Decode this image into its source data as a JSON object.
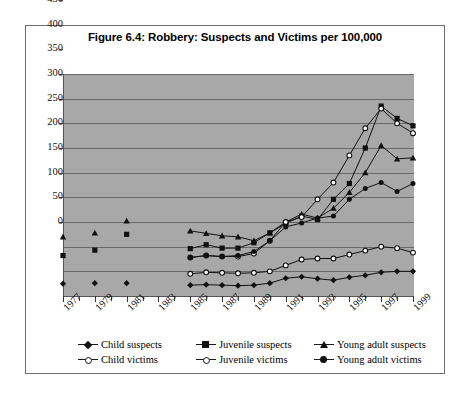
{
  "figure": {
    "title": "Figure 6.4: Robbery: Suspects and Victims per 100,000"
  },
  "legend": {
    "items": [
      {
        "label": "Child suspects",
        "marker": "diamond-filled"
      },
      {
        "label": "Juvenile suspects",
        "marker": "square-filled"
      },
      {
        "label": "Young adult suspects",
        "marker": "triangle-filled"
      },
      {
        "label": "Child victims",
        "marker": "circle-open"
      },
      {
        "label": "Juvenile victims",
        "marker": "circle-open"
      },
      {
        "label": "Young adult victims",
        "marker": "circle-filled"
      }
    ]
  },
  "chart_data": {
    "type": "line",
    "title": "Figure 6.4: Robbery: Suspects and Victims per 100,000",
    "xlabel": "",
    "ylabel": "",
    "ylim": [
      0,
      450
    ],
    "ytick_step": 50,
    "yticks": [
      "0",
      "50",
      "100",
      "150",
      "200",
      "250",
      "300",
      "350",
      "400",
      "450"
    ],
    "grid": true,
    "legend_position": "bottom",
    "plot_background": "#a8a8a8",
    "x": [
      1977,
      1978,
      1979,
      1980,
      1981,
      1982,
      1983,
      1984,
      1985,
      1986,
      1987,
      1988,
      1989,
      1990,
      1991,
      1992,
      1993,
      1994,
      1995,
      1996,
      1997,
      1998,
      1999
    ],
    "xtick_labels": [
      "1977",
      "1979",
      "1981",
      "1983",
      "1985",
      "1987",
      "1989",
      "1991",
      "1993",
      "1995",
      "1997",
      "1999"
    ],
    "series": [
      {
        "name": "Child suspects",
        "marker": "diamond-filled",
        "color": "#111111",
        "x": [
          1977,
          1979,
          1981,
          1985,
          1986,
          1987,
          1988,
          1989,
          1990,
          1991,
          1992,
          1993,
          1994,
          1995,
          1996,
          1997,
          1998,
          1999
        ],
        "values": [
          25,
          26,
          26,
          22,
          23,
          22,
          21,
          22,
          26,
          36,
          39,
          35,
          32,
          38,
          42,
          48,
          50,
          50
        ]
      },
      {
        "name": "Juvenile suspects",
        "marker": "square-filled",
        "color": "#111111",
        "x": [
          1977,
          1979,
          1981,
          1985,
          1986,
          1987,
          1988,
          1989,
          1990,
          1991,
          1992,
          1993,
          1994,
          1995,
          1996,
          1997,
          1998,
          1999
        ],
        "values": [
          82,
          93,
          125,
          96,
          104,
          97,
          97,
          108,
          128,
          147,
          162,
          155,
          196,
          228,
          300,
          385,
          360,
          345
        ]
      },
      {
        "name": "Young adult suspects",
        "marker": "triangle-filled",
        "color": "#111111",
        "x": [
          1977,
          1979,
          1981,
          1985,
          1986,
          1987,
          1988,
          1989,
          1990,
          1991,
          1992,
          1993,
          1994,
          1995,
          1996,
          1997,
          1998,
          1999
        ],
        "values": [
          120,
          128,
          152,
          132,
          127,
          122,
          120,
          112,
          128,
          150,
          166,
          158,
          178,
          210,
          250,
          305,
          278,
          280
        ]
      },
      {
        "name": "Child victims",
        "marker": "circle-open",
        "color": "#111111",
        "x": [
          1985,
          1986,
          1987,
          1988,
          1989,
          1990,
          1991,
          1992,
          1993,
          1994,
          1995,
          1996,
          1997,
          1998,
          1999
        ],
        "values": [
          45,
          48,
          47,
          46,
          47,
          50,
          62,
          74,
          76,
          76,
          84,
          92,
          100,
          97,
          88
        ]
      },
      {
        "name": "Juvenile victims",
        "marker": "circle-open",
        "color": "#111111",
        "x": [
          1985,
          1986,
          1987,
          1988,
          1989,
          1990,
          1991,
          1992,
          1993,
          1994,
          1995,
          1996,
          1997,
          1998,
          1999
        ],
        "values": [
          78,
          82,
          80,
          80,
          86,
          112,
          150,
          160,
          196,
          230,
          285,
          340,
          380,
          350,
          330
        ]
      },
      {
        "name": "Young adult victims",
        "marker": "circle-filled",
        "color": "#111111",
        "x": [
          1985,
          1986,
          1987,
          1988,
          1989,
          1990,
          1991,
          1992,
          1993,
          1994,
          1995,
          1996,
          1997,
          1998,
          1999
        ],
        "values": [
          78,
          82,
          80,
          82,
          90,
          112,
          140,
          148,
          158,
          162,
          196,
          218,
          230,
          212,
          228
        ]
      }
    ]
  }
}
